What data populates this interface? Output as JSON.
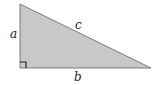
{
  "diagram": {
    "type": "right-triangle",
    "labels": {
      "a": "a",
      "b": "b",
      "c": "c"
    },
    "fill_color": "#c8c8c8",
    "stroke_color": "#555555",
    "right_angle_marker": true
  }
}
